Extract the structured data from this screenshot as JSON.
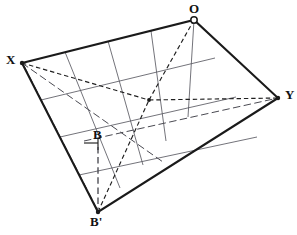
{
  "figure": {
    "kind": "geometric-construction-diagram",
    "background_color": "#ffffff",
    "ink_color": "#1a1a1a",
    "grid_color": "#5a5a62",
    "dashed_color": "#1f1f1f"
  },
  "labels": {
    "x": "X",
    "o": "O",
    "y": "Y",
    "b": "B",
    "b_prime": "B'"
  },
  "vertices": {
    "X": {
      "x": 22,
      "y": 63,
      "label": "X",
      "marker": "dot"
    },
    "O": {
      "x": 194,
      "y": 20,
      "label": "O",
      "marker": "ring"
    },
    "Y": {
      "x": 278,
      "y": 98,
      "label": "Y",
      "marker": "dot"
    },
    "Bp": {
      "x": 98,
      "y": 212,
      "label": "B'",
      "marker": "dot"
    },
    "B": {
      "x": 98,
      "y": 143,
      "label": "B",
      "marker": "none"
    },
    "center": {
      "x": 149,
      "y": 100,
      "label": "",
      "marker": "dot"
    }
  },
  "outline": {
    "name": "quadrilateral-outline",
    "points": "22,63 194,20 278,98 98,212 22,63",
    "stroke_width": 2.1,
    "closed": true
  },
  "grid": {
    "divisions_xo_to_bpy": 4,
    "divisions_xbp_to_oy": 4,
    "stroke_width": 0.85,
    "family_a": [
      {
        "name": "grid-a-1",
        "from": [
          65,
          52
        ],
        "to": [
          120,
          188
        ]
      },
      {
        "name": "grid-a-2",
        "from": [
          108,
          41
        ],
        "to": [
          143,
          165
        ]
      },
      {
        "name": "grid-a-3",
        "from": [
          151,
          31
        ],
        "to": [
          166,
          141
        ]
      },
      {
        "name": "grid-a-4",
        "from": [
          194,
          20
        ],
        "to": [
          188,
          117
        ]
      }
    ],
    "family_b": [
      {
        "name": "grid-b-1",
        "from": [
          41,
          100
        ],
        "to": [
          215,
          58
        ]
      },
      {
        "name": "grid-b-2",
        "from": [
          60,
          137
        ],
        "to": [
          236,
          97
        ]
      },
      {
        "name": "grid-b-3",
        "from": [
          79,
          175
        ],
        "to": [
          257,
          137
        ]
      }
    ]
  },
  "construction_lines": {
    "dashed": [
      {
        "name": "dashed-x-to-y",
        "from": [
          22,
          63
        ],
        "to": [
          278,
          98
        ],
        "via": [
          149,
          100
        ]
      },
      {
        "name": "dashed-bp-to-o",
        "from": [
          98,
          212
        ],
        "to": [
          194,
          20
        ],
        "via": [
          149,
          100
        ]
      }
    ],
    "dash_dot": [
      {
        "name": "dashdot-x-to-bp-bottom",
        "from": [
          22,
          63
        ],
        "to": [
          160,
          160
        ]
      },
      {
        "name": "dashdot-b-to-y",
        "from": [
          84,
          141
        ],
        "to": [
          278,
          98
        ]
      },
      {
        "name": "dashdot-x-lower-ray",
        "from": [
          22,
          63
        ],
        "to": [
          98,
          212
        ]
      }
    ],
    "vertical": [
      {
        "name": "vertical-b-to-bp",
        "from": [
          98,
          145
        ],
        "to": [
          98,
          210
        ]
      }
    ],
    "solid_thin": [
      {
        "name": "b-tick-horizontal",
        "from": [
          84,
          143
        ],
        "to": [
          98,
          143
        ]
      }
    ]
  },
  "markers": {
    "o_marker_style": "open-circle",
    "vertex_dot_radius": 2.0,
    "o_ring_radius": 3.4,
    "center_dot_radius": 1.9
  }
}
